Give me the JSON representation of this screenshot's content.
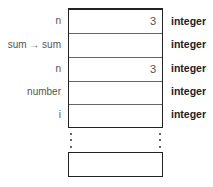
{
  "rows": [
    {
      "label": "n",
      "value": "3",
      "type": "integer"
    },
    {
      "label": "sum → sum",
      "value": "",
      "type": "integer"
    },
    {
      "label": "n",
      "value": "3",
      "type": "integer"
    },
    {
      "label": "number",
      "value": "",
      "type": "integer"
    },
    {
      "label": "i",
      "value": "",
      "type": "integer"
    }
  ],
  "continuation": "⋮"
}
